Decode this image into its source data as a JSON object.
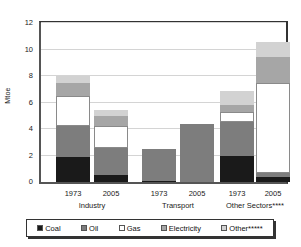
{
  "chart_data": {
    "type": "bar",
    "stacked": true,
    "title": "",
    "xlabel": "",
    "ylabel": "Mtoe",
    "ylim": [
      0,
      12
    ],
    "ytick_labels": [
      "0",
      "2",
      "4",
      "6",
      "8",
      "10",
      "12"
    ],
    "ytick_values": [
      0,
      2,
      4,
      6,
      8,
      10,
      12
    ],
    "grid": true,
    "legend_position": "bottom",
    "categories": [
      "1973",
      "2005",
      "1973",
      "2005",
      "1973",
      "2005"
    ],
    "groups": [
      {
        "label": "Industry",
        "years": [
          "1973",
          "2005"
        ]
      },
      {
        "label": "Transport",
        "years": [
          "1973",
          "2005"
        ]
      },
      {
        "label": "Other Sectors****",
        "years": [
          "1973",
          "2005"
        ]
      }
    ],
    "series": [
      {
        "name": "Coal",
        "color": "#1a1a1a",
        "values": [
          1.9,
          0.5,
          0.1,
          0.0,
          2.0,
          0.35
        ]
      },
      {
        "name": "Oil",
        "color": "#7d7d7d",
        "values": [
          2.3,
          2.1,
          2.4,
          4.4,
          2.5,
          0.35
        ]
      },
      {
        "name": "Gas",
        "color": "#ffffff",
        "values": [
          2.3,
          1.6,
          0.0,
          0.0,
          0.8,
          6.8
        ]
      },
      {
        "name": "Electricity",
        "color": "#a6a6a6",
        "values": [
          1.0,
          0.8,
          0.0,
          0.0,
          0.5,
          1.9
        ]
      },
      {
        "name": "Other*****",
        "color": "#d2d2d2",
        "values": [
          0.5,
          0.4,
          0.0,
          0.0,
          1.1,
          1.2
        ]
      }
    ],
    "totals": [
      8.0,
      5.4,
      2.5,
      4.4,
      6.9,
      10.6
    ],
    "legend": [
      "Coal",
      "Oil",
      "Gas",
      "Electricity",
      "Other*****"
    ]
  }
}
